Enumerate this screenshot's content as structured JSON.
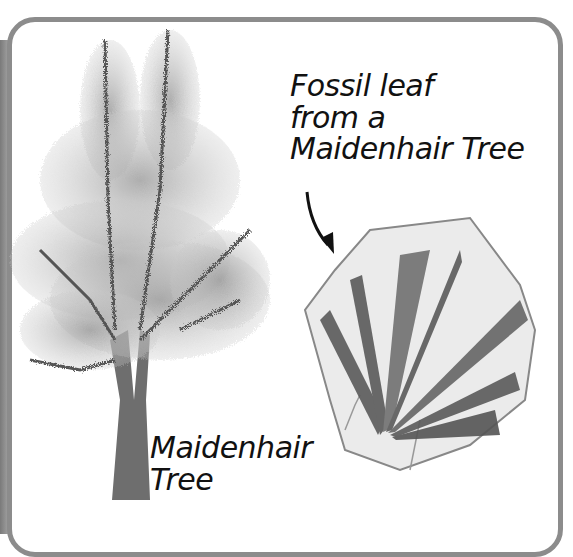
{
  "illustration": {
    "labels": {
      "fossil": {
        "line1": "Fossil leaf",
        "line2": "from a",
        "line3": "Maidenhair Tree"
      },
      "tree": {
        "line1": "Maidenhair",
        "line2": "Tree"
      }
    },
    "colors": {
      "frame_border": "#8c8c8c",
      "text": "#111111",
      "leaf_dark": "#4a4a4a",
      "rock": "#e6e6e6"
    }
  }
}
